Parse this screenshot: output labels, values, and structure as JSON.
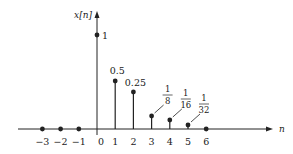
{
  "chart_data": {
    "type": "stem",
    "title": "",
    "ylabel": "x[n]",
    "xlabel": "n",
    "x": [
      -3,
      -2,
      -1,
      0,
      1,
      2,
      3,
      4,
      5,
      6
    ],
    "values": [
      0,
      0,
      0,
      1,
      0.5,
      0.25,
      0.125,
      0.0625,
      0.03125,
      0
    ],
    "point_labels": [
      {
        "n": 0,
        "text": "1"
      },
      {
        "n": 1,
        "text": "0.5"
      },
      {
        "n": 2,
        "text": "0.25"
      },
      {
        "n": 3,
        "num": "1",
        "den": "8"
      },
      {
        "n": 4,
        "num": "1",
        "den": "16"
      },
      {
        "n": 5,
        "num": "1",
        "den": "32"
      }
    ],
    "tick_labels": [
      "−3",
      "−2",
      "−1",
      "0",
      "1",
      "2",
      "3",
      "4",
      "5",
      "6"
    ],
    "grid": false,
    "legend": null
  },
  "layout": {
    "axis_y": 129,
    "origin_x": 97,
    "spacing": 18.2,
    "stem_tops": {
      "0": 35,
      "1": 81,
      "2": 92,
      "3": 116,
      "4": 120,
      "5": 125
    },
    "color": "#222222"
  }
}
